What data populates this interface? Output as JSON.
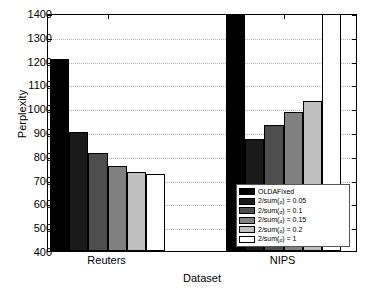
{
  "chart_data": {
    "type": "bar",
    "title": "",
    "xlabel": "Dataset",
    "ylabel": "Perplexity",
    "categories": [
      "Reuters",
      "NIPS"
    ],
    "ylim": [
      400,
      1400
    ],
    "yticks": [
      400,
      500,
      600,
      700,
      800,
      900,
      1000,
      1100,
      1200,
      1300,
      1400
    ],
    "grid": true,
    "legend_position": "inside-bottom-right",
    "series": [
      {
        "name": "OLDAFixed",
        "color": "#000000",
        "values": [
          1205,
          1390
        ]
      },
      {
        "name": "2/sum(a) = 0.05",
        "color": "#1a1a1a",
        "values": [
          900,
          870
        ]
      },
      {
        "name": "2/sum(a) = 0.1",
        "color": "#4d4d4d",
        "values": [
          810,
          930
        ]
      },
      {
        "name": "2/sum(a) = 0.15",
        "color": "#808080",
        "values": [
          758,
          985
        ]
      },
      {
        "name": "2/sum(a) = 0.2",
        "color": "#bfbfbf",
        "values": [
          732,
          1032
        ]
      },
      {
        "name": "2/sum(a) = 1",
        "color": "#ffffff",
        "values": [
          722,
          1400
        ]
      }
    ]
  },
  "axis": {
    "y_title": "Perplexity",
    "x_title": "Dataset",
    "y_tick_labels": [
      "1400",
      "1300",
      "1200",
      "1100",
      "1000",
      "900",
      "800",
      "700",
      "600",
      "500",
      "400"
    ],
    "x_tick_labels": [
      "Reuters",
      "NIPS"
    ]
  },
  "legend": {
    "entries": [
      {
        "label": "OLDAFixed",
        "prefix": "OLDAFixed",
        "subscript": "",
        "suffix": ""
      },
      {
        "label": "2/sum(α) = 0.05",
        "prefix": "2/sum(",
        "subscript": "α",
        "suffix": ") = 0.05"
      },
      {
        "label": "2/sum(α) = 0.1",
        "prefix": "2/sum(",
        "subscript": "α",
        "suffix": ") = 0.1"
      },
      {
        "label": "2/sum(α) = 0.15",
        "prefix": "2/sum(",
        "subscript": "α",
        "suffix": ") = 0.15"
      },
      {
        "label": "2/sum(α) = 0.2",
        "prefix": "2/sum(",
        "subscript": "α",
        "suffix": ") = 0.2"
      },
      {
        "label": "2/sum(α) = 1",
        "prefix": "2/sum(",
        "subscript": "α",
        "suffix": ") = 1"
      }
    ]
  }
}
